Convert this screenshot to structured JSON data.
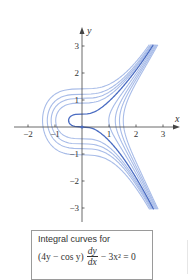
{
  "chart_data": {
    "type": "line",
    "implicit_solution": "2y^2 - sin y - x^3 = C",
    "xlabel": "x",
    "ylabel": "y",
    "xlim": [
      -2.3,
      3.5
    ],
    "ylim": [
      -3.5,
      3.6
    ],
    "x_ticks": [
      -2,
      -1,
      1,
      2,
      3
    ],
    "y_ticks": [
      -3,
      -2,
      -1,
      1,
      2,
      3
    ],
    "x_tick_labels": [
      "−2",
      "−1",
      "1",
      "2",
      "3"
    ],
    "y_tick_labels": [
      "−3",
      "−2",
      "−1",
      "1",
      "2",
      "3"
    ],
    "grid": false,
    "legend": null,
    "curve_y_range": [
      -3.05,
      3.05
    ],
    "series": [
      {
        "name": "C = 0 (through origin)",
        "C": 0,
        "color": "#4a6cc2",
        "width": 1.3,
        "highlight": true
      },
      {
        "name": "C = 0.8",
        "C": 0.8,
        "color": "#a8bce8",
        "width": 1.1
      },
      {
        "name": "C = 1.37",
        "C": 1.37,
        "color": "#a8bce8",
        "width": 1.1
      },
      {
        "name": "C = 2.0",
        "C": 2.0,
        "color": "#a8bce8",
        "width": 1.1
      },
      {
        "name": "C = 3.0",
        "C": 3.0,
        "color": "#a8bce8",
        "width": 1.1
      },
      {
        "name": "C = -1.1",
        "C": -1.1,
        "color": "#a8bce8",
        "width": 1.1
      },
      {
        "name": "C = -2.0",
        "C": -2.0,
        "color": "#a8bce8",
        "width": 1.1
      },
      {
        "name": "C = -2.8",
        "C": -2.8,
        "color": "#a8bce8",
        "width": 1.1
      },
      {
        "name": "C = -3.7",
        "C": -3.7,
        "color": "#a8bce8",
        "width": 1.1
      }
    ],
    "marked_point": {
      "x": 0,
      "y": 0,
      "color": "#4a6cc2"
    },
    "annotations": []
  },
  "caption": {
    "title": "Integral curves for",
    "eq_left": "(4y − cos y)",
    "frac_num": "dy",
    "frac_den": "dx",
    "eq_right": "− 3x² = 0"
  },
  "colors": {
    "axis": "#444444",
    "dark_curve": "#4a6cc2",
    "light_curve": "#a8bce8"
  }
}
